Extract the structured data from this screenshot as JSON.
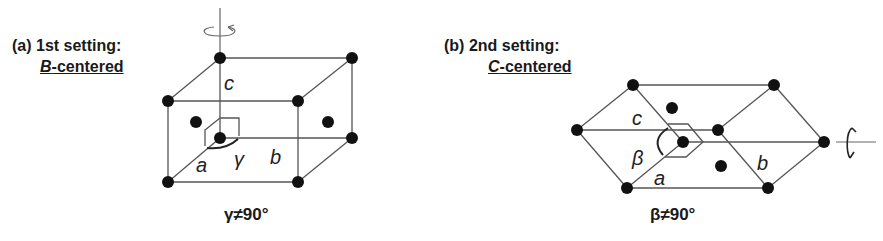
{
  "panels": [
    {
      "id": "a",
      "caption": "(a) 1st setting:",
      "centering_letter": "B",
      "centering_suffix": "-centered",
      "axis_labels": {
        "a": "a",
        "b": "b",
        "c": "c"
      },
      "angle_symbol": "γ",
      "condition": "γ≠90°",
      "rotation_axis": "vertical (c)"
    },
    {
      "id": "b",
      "caption": "(b) 2nd setting:",
      "centering_letter": "C",
      "centering_suffix": "-centered",
      "axis_labels": {
        "a": "a",
        "b": "b",
        "c": "c"
      },
      "angle_symbol": "β",
      "condition": "β≠90°",
      "rotation_axis": "horizontal (b)"
    }
  ]
}
